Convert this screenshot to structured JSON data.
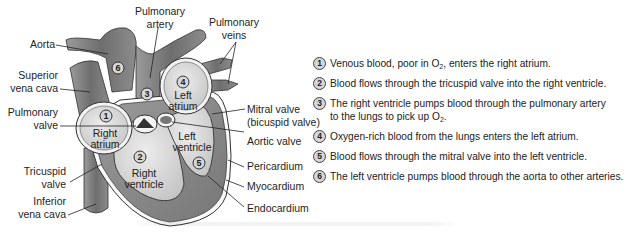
{
  "diagram": {
    "title_hidden": "Heart structure and blood flow",
    "colors": {
      "vessel": "#7c7c7c",
      "vessel_dark": "#5e5e5e",
      "chamber": "#d9d9d9",
      "muscle": "#8a8a8a",
      "outline": "#2a2a2a",
      "badge": "#d6d6d6"
    },
    "labels": {
      "aorta": "Aorta",
      "superior_vena_cava_1": "Superior",
      "superior_vena_cava_2": "vena cava",
      "pulmonary_valve_1": "Pulmonary",
      "pulmonary_valve_2": "valve",
      "tricuspid_valve_1": "Tricuspid",
      "tricuspid_valve_2": "valve",
      "inferior_vena_cava_1": "Inferior",
      "inferior_vena_cava_2": "vena cava",
      "pulmonary_artery_1": "Pulmonary",
      "pulmonary_artery_2": "artery",
      "pulmonary_veins_1": "Pulmonary",
      "pulmonary_veins_2": "veins",
      "mitral_valve_1": "Mitral valve",
      "mitral_valve_2": "(bicuspid valve)",
      "aortic_valve": "Aortic valve",
      "pericardium": "Pericardium",
      "myocardium": "Myocardium",
      "endocardium": "Endocardium"
    },
    "chambers": {
      "right_atrium_1": "Right",
      "right_atrium_2": "atrium",
      "right_ventricle_1": "Right",
      "right_ventricle_2": "ventricle",
      "left_atrium_1": "Left",
      "left_atrium_2": "atrium",
      "left_ventricle_1": "Left",
      "left_ventricle_2": "ventricle"
    },
    "markers": [
      "1",
      "2",
      "3",
      "4",
      "5",
      "6"
    ]
  },
  "steps": [
    {
      "num": "1",
      "pre": "Venous blood, poor in O",
      "sub": "2",
      "post": ", enters the right atrium."
    },
    {
      "num": "2",
      "pre": "Blood flows through the tricuspid valve into the right ventricle.",
      "sub": "",
      "post": ""
    },
    {
      "num": "3",
      "pre": "The right ventricle pumps blood through the pulmonary artery to the lungs to pick up O",
      "sub": "2",
      "post": "."
    },
    {
      "num": "4",
      "pre": "Oxygen-rich blood from the lungs enters the left atrium.",
      "sub": "",
      "post": ""
    },
    {
      "num": "5",
      "pre": "Blood flows through the mitral valve into the left ventricle.",
      "sub": "",
      "post": ""
    },
    {
      "num": "6",
      "pre": "The left ventricle pumps blood through the aorta to other arteries.",
      "sub": "",
      "post": ""
    }
  ]
}
